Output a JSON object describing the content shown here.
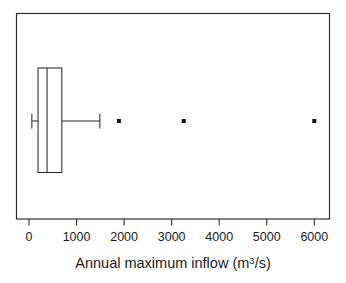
{
  "chart_data": {
    "type": "box",
    "orientation": "horizontal",
    "title": "",
    "xlabel_text": "Annual maximum inflow (m",
    "xlabel_sup": "3",
    "xlabel_tail": "/s)",
    "xlabel_full": "Annual maximum inflow (m3/s)",
    "ylabel": "",
    "xlim": [
      -200,
      6330
    ],
    "ylim": [
      0,
      1
    ],
    "grid": false,
    "legend": null,
    "xticks": [
      0,
      1000,
      2000,
      3000,
      4000,
      5000,
      6000
    ],
    "xtick_labels": [
      "0",
      "1000",
      "2000",
      "3000",
      "4000",
      "5000",
      "6000"
    ],
    "ytick_labels": [],
    "boxes": [
      {
        "name": "Annual maximum inflow",
        "whisker_low": 60,
        "q1": 190,
        "median": 380,
        "q3": 690,
        "whisker_high": 1490,
        "outliers": [
          1890,
          3255,
          6000
        ]
      }
    ],
    "colors": {
      "line": "#2b2b2b",
      "box_fill": "#ffffff",
      "outlier": "#111111",
      "background": "#ffffff",
      "text": "#1a1a1a"
    }
  }
}
